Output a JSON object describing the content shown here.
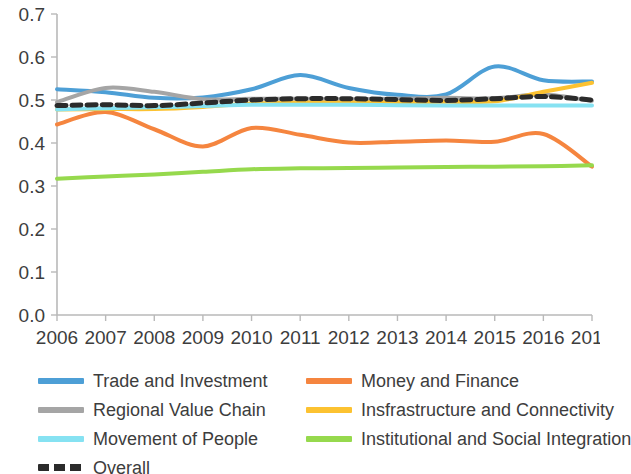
{
  "chart_data": {
    "type": "line",
    "title": "",
    "subtitle": "",
    "xlabel": "",
    "ylabel": "",
    "x": [
      2006,
      2007,
      2008,
      2009,
      2010,
      2011,
      2012,
      2013,
      2014,
      2015,
      2016,
      2017
    ],
    "categories": [
      "2006",
      "2007",
      "2008",
      "2009",
      "2010",
      "2011",
      "2012",
      "2013",
      "2014",
      "2015",
      "2016",
      "2017"
    ],
    "xtick_labels": [
      "2006",
      "2007",
      "2008",
      "2009",
      "2010",
      "2011",
      "2012",
      "2013",
      "2014",
      "2015",
      "2016",
      "2017"
    ],
    "ytick_labels": [
      "0.0",
      "0.1",
      "0.2",
      "0.3",
      "0.4",
      "0.5",
      "0.6",
      "0.7"
    ],
    "ytick_values": [
      0.0,
      0.1,
      0.2,
      0.3,
      0.4,
      0.5,
      0.6,
      0.7
    ],
    "ylim": [
      0.0,
      0.7
    ],
    "xlim": [
      2006,
      2017
    ],
    "grid": false,
    "legend_position": "bottom",
    "smoothing": "spline",
    "series": [
      {
        "name": "Trade and Investment",
        "color": "#4d9fd6",
        "style": "solid",
        "width": 4,
        "values": [
          0.525,
          0.518,
          0.505,
          0.506,
          0.525,
          0.558,
          0.528,
          0.512,
          0.513,
          0.578,
          0.546,
          0.543
        ]
      },
      {
        "name": "Money and Finance",
        "color": "#f5853f",
        "style": "solid",
        "width": 4,
        "values": [
          0.443,
          0.472,
          0.432,
          0.392,
          0.435,
          0.419,
          0.401,
          0.403,
          0.406,
          0.403,
          0.421,
          0.345
        ]
      },
      {
        "name": "Regional Value Chain",
        "color": "#a5a5a5",
        "style": "solid",
        "width": 4,
        "values": [
          0.495,
          0.528,
          0.519,
          0.502,
          0.503,
          0.503,
          0.502,
          0.503,
          0.505,
          0.504,
          0.513,
          0.498
        ]
      },
      {
        "name": "Insfrastructure and Connectivity",
        "color": "#fcc231",
        "style": "solid",
        "width": 4,
        "values": [
          0.478,
          0.479,
          0.479,
          0.484,
          0.492,
          0.494,
          0.494,
          0.495,
          0.496,
          0.497,
          0.519,
          0.54
        ]
      },
      {
        "name": "Movement of People",
        "color": "#86e2f2",
        "style": "solid",
        "width": 4,
        "values": [
          0.478,
          0.481,
          0.483,
          0.486,
          0.489,
          0.489,
          0.489,
          0.488,
          0.487,
          0.487,
          0.487,
          0.487
        ]
      },
      {
        "name": "Institutional and Social Integration",
        "color": "#96d94d",
        "style": "solid",
        "width": 4,
        "values": [
          0.317,
          0.322,
          0.327,
          0.333,
          0.339,
          0.341,
          0.342,
          0.343,
          0.344,
          0.345,
          0.346,
          0.348
        ]
      },
      {
        "name": "Overall",
        "color": "#2b2b2b",
        "style": "dashed",
        "width": 5,
        "values": [
          0.487,
          0.489,
          0.487,
          0.493,
          0.5,
          0.503,
          0.503,
          0.501,
          0.499,
          0.503,
          0.508,
          0.5
        ]
      }
    ]
  },
  "legend": {
    "columns": [
      {
        "items": [
          {
            "label": "Trade and Investment",
            "color": "#4d9fd6",
            "style": "solid",
            "swatch_name": "legend-swatch-trade-and-investment"
          },
          {
            "label": "Regional Value Chain",
            "color": "#a5a5a5",
            "style": "solid",
            "swatch_name": "legend-swatch-regional-value-chain"
          },
          {
            "label": "Movement of People",
            "color": "#86e2f2",
            "style": "solid",
            "swatch_name": "legend-swatch-movement-of-people"
          },
          {
            "label": "Overall",
            "color": "#2b2b2b",
            "style": "dashed",
            "swatch_name": "legend-swatch-overall"
          }
        ]
      },
      {
        "items": [
          {
            "label": "Money and Finance",
            "color": "#f5853f",
            "style": "solid",
            "swatch_name": "legend-swatch-money-and-finance"
          },
          {
            "label": "Insfrastructure and Connectivity",
            "color": "#fcc231",
            "style": "solid",
            "swatch_name": "legend-swatch-infrastructure-and-connectivity"
          },
          {
            "label": "Institutional and Social Integration",
            "color": "#96d94d",
            "style": "solid",
            "swatch_name": "legend-swatch-institutional-and-social-integration"
          }
        ]
      }
    ]
  },
  "axes": {
    "axis_color": "#b9b9b9",
    "tick_label_color": "#3d3d3d"
  }
}
